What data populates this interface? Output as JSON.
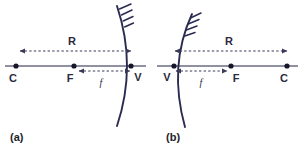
{
  "figure": {
    "background_color": "#ffffff",
    "accent_color": "#2b2b52",
    "axis_color": "#6b6b80"
  },
  "panels": [
    {
      "id": "a",
      "caption": "(a)",
      "mirror_type": "concave-mirror",
      "mirror_opens": "left",
      "points": [
        {
          "name": "center-of-curvature",
          "label": "C",
          "x": 16,
          "y": 66,
          "label_x": 13,
          "label_y": 82
        },
        {
          "name": "focal-point",
          "label": "F",
          "x": 74,
          "y": 66,
          "label_x": 70,
          "label_y": 82
        },
        {
          "name": "vertex",
          "label": "V",
          "x": 131,
          "y": 66,
          "label_x": 136,
          "label_y": 81
        }
      ],
      "dimensions": [
        {
          "name": "radius-of-curvature",
          "label": "R",
          "label_x": 72,
          "label_y": 45,
          "from_x": 20,
          "to_x": 131,
          "y": 51,
          "arrow_start": true,
          "arrow_end": true,
          "italic": false
        },
        {
          "name": "focal-length",
          "label": "f",
          "label_x": 101,
          "label_y": 86,
          "from_x": 79,
          "to_x": 130,
          "y": 71,
          "arrow_start": true,
          "arrow_end": true,
          "italic": true
        }
      ]
    },
    {
      "id": "b",
      "caption": "(b)",
      "mirror_type": "convex-mirror",
      "mirror_opens": "right",
      "points": [
        {
          "name": "vertex",
          "label": "V",
          "x": 174,
          "y": 66,
          "label_x": 166,
          "label_y": 81
        },
        {
          "name": "focal-point",
          "label": "F",
          "x": 231,
          "y": 66,
          "label_x": 234,
          "label_y": 82
        },
        {
          "name": "center-of-curvature",
          "label": "C",
          "x": 287,
          "y": 66,
          "label_x": 283,
          "label_y": 82
        }
      ],
      "dimensions": [
        {
          "name": "radius-of-curvature",
          "label": "R",
          "label_x": 229,
          "label_y": 45,
          "from_x": 175,
          "to_x": 287,
          "y": 51,
          "arrow_start": true,
          "arrow_end": true,
          "italic": false
        },
        {
          "name": "focal-length",
          "label": "f",
          "label_x": 201,
          "label_y": 86,
          "from_x": 176,
          "to_x": 227,
          "y": 71,
          "arrow_start": true,
          "arrow_end": true,
          "italic": true
        }
      ]
    }
  ],
  "captions": {
    "a": {
      "text": "(a)",
      "x": 10,
      "y": 141
    },
    "b": {
      "text": "(b)",
      "x": 166,
      "y": 141
    }
  }
}
